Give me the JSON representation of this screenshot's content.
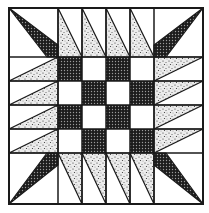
{
  "image": {
    "subject": "quilt-block-pattern",
    "description": "Square quilt block: central 4x4 checkerboard surrounded by pinwheel-like triangles, dark kite triangles in each corner",
    "colors": {
      "background": "#ffffff",
      "line": "#1a1a1a",
      "dark_fill": "#2a2a2a",
      "speckle_fill": "#d6d6d6"
    },
    "grid": {
      "outer": [
        9,
        8,
        203,
        204
      ],
      "center_checkerboard": {
        "rows": 4,
        "cols": 4,
        "x0": 58,
        "y0": 57,
        "cell": 24,
        "dark_cells": [
          [
            0,
            0
          ],
          [
            0,
            2
          ],
          [
            1,
            1
          ],
          [
            1,
            3
          ],
          [
            2,
            0
          ],
          [
            2,
            2
          ],
          [
            3,
            1
          ],
          [
            3,
            3
          ]
        ]
      }
    }
  }
}
